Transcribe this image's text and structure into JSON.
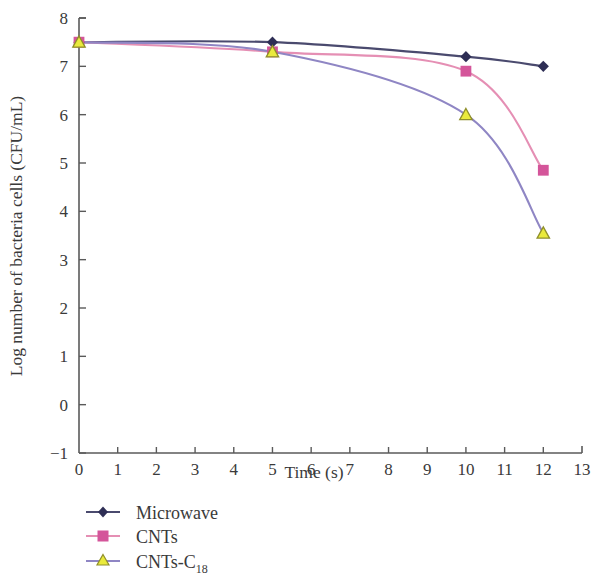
{
  "chart_data": {
    "type": "line",
    "title": "",
    "xlabel": "Time (s)",
    "ylabel": "Log number of bacteria cells (CFU/mL)",
    "xlim": [
      0,
      13
    ],
    "ylim": [
      -1,
      8
    ],
    "x_ticks": [
      "0",
      "1",
      "2",
      "3",
      "4",
      "5",
      "6",
      "7",
      "8",
      "9",
      "10",
      "11",
      "12",
      "13"
    ],
    "y_ticks": [
      "-1",
      "0",
      "1",
      "2",
      "3",
      "4",
      "5",
      "6",
      "7",
      "8"
    ],
    "grid": false,
    "legend_position": "bottom-left",
    "x": [
      0,
      5,
      10,
      12
    ],
    "series": [
      {
        "name": "Microwave",
        "marker": "diamond",
        "line_color": "#4a4a6e",
        "marker_color": "#2e2e55",
        "values": [
          7.5,
          7.5,
          7.2,
          7.0
        ]
      },
      {
        "name": "CNTs",
        "marker": "square",
        "line_color": "#e58fb4",
        "marker_color": "#d4559a",
        "values": [
          7.5,
          7.3,
          6.9,
          4.85
        ]
      },
      {
        "name": "CNTs-C",
        "name_subscript": "18",
        "marker": "triangle",
        "line_color": "#8f86c4",
        "marker_color": "#eaea3c",
        "marker_edge_color": "#8f8f2a",
        "values": [
          7.5,
          7.3,
          6.0,
          3.55
        ]
      }
    ]
  },
  "axes": {
    "x_axis_label": "Time (s)",
    "y_axis_label": "Log number of bacteria cells (CFU/mL)",
    "x_tick_0": "0",
    "x_tick_1": "1",
    "x_tick_2": "2",
    "x_tick_3": "3",
    "x_tick_4": "4",
    "x_tick_5": "5",
    "x_tick_6": "6",
    "x_tick_7": "7",
    "x_tick_8": "8",
    "x_tick_9": "9",
    "x_tick_10": "10",
    "x_tick_11": "11",
    "x_tick_12": "12",
    "x_tick_13": "13",
    "y_tick_m1": "-1",
    "y_tick_0": "0",
    "y_tick_1": "1",
    "y_tick_2": "2",
    "y_tick_3": "3",
    "y_tick_4": "4",
    "y_tick_5": "5",
    "y_tick_6": "6",
    "y_tick_7": "7",
    "y_tick_8": "8"
  },
  "legend": {
    "items": [
      {
        "label": "Microwave",
        "sub": ""
      },
      {
        "label": "CNTs",
        "sub": ""
      },
      {
        "label": "CNTs-C",
        "sub": "18"
      }
    ],
    "item_0_label": "Microwave",
    "item_1_label": "CNTs",
    "item_2_label": "CNTs-C",
    "item_2_sub": "18"
  },
  "colors": {
    "axis": "#5a5a5a",
    "microwave": "#4a4a6e",
    "cnts": "#e58fb4",
    "cnts_c18_line": "#8f86c4",
    "cnts_c18_marker": "#eaea3c",
    "background": "#ffffff"
  }
}
